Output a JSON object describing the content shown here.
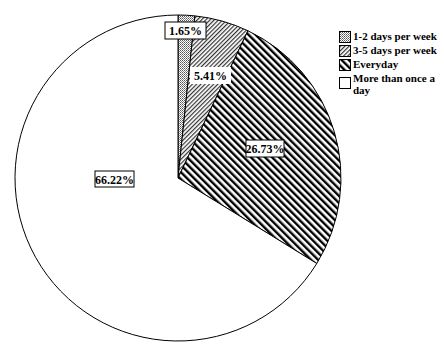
{
  "chart_data": {
    "type": "pie",
    "title": "",
    "start_angle": "12 o'clock",
    "direction": "clockwise",
    "slices": [
      {
        "label": "1-2 days per week",
        "value": 1.65,
        "display": "1.65%",
        "pattern": "dots"
      },
      {
        "label": "3-5 days per week",
        "value": 5.41,
        "display": "5.41%",
        "pattern": "forward-diagonal-fine"
      },
      {
        "label": "Everyday",
        "value": 26.73,
        "display": "26.73%",
        "pattern": "backward-diagonal"
      },
      {
        "label": "More than once a day",
        "value": 66.22,
        "display": "66.22%",
        "pattern": "none"
      }
    ],
    "legend_position": "right"
  },
  "legend": {
    "items": [
      {
        "label": "1-2 days per week"
      },
      {
        "label": "3-5 days per week"
      },
      {
        "label": "Everyday"
      },
      {
        "label": "More than once a day"
      }
    ]
  },
  "labels": {
    "s1": "1.65%",
    "s2": "5.41%",
    "s3": "26.73%",
    "s4": "66.22%"
  }
}
